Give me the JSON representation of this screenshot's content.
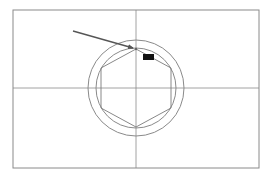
{
  "drawing": {
    "background": "#ffffff",
    "line_color": "#8a8a8a",
    "frame": {
      "x": 13,
      "y": 10,
      "width": 246,
      "height": 158
    },
    "crosshair": {
      "cx": 136,
      "cy": 88
    },
    "outer_circle": {
      "cx": 136,
      "cy": 88,
      "r": 48
    },
    "inner_circle": {
      "cx": 136,
      "cy": 88,
      "r": 40
    },
    "hexagon": {
      "cx": 136,
      "cy": 88,
      "points": "136,49 171,68 171,108 136,127 101,108 101,68"
    },
    "arrow": {
      "color": "#555555",
      "x1": 73,
      "y1": 31,
      "x2": 134,
      "y2": 48
    }
  },
  "snap_tooltip": {
    "label": "",
    "background": "#111111"
  }
}
